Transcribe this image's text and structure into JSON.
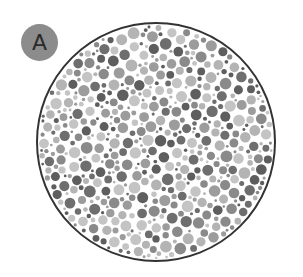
{
  "badge": {
    "label": "A",
    "color": "#8c8c8c",
    "text_color": "#2a2a2a"
  },
  "plate": {
    "description": "Grayscale color-vision test plate of random dots",
    "center": [
      156,
      142
    ],
    "radius": 119,
    "border_color": "#333333",
    "dot_colors": [
      "#5e5e5e",
      "#6e6e6e",
      "#8a8a8a",
      "#9c9c9c",
      "#b4b4b4",
      "#c4c4c4"
    ],
    "background": "#ffffff"
  }
}
